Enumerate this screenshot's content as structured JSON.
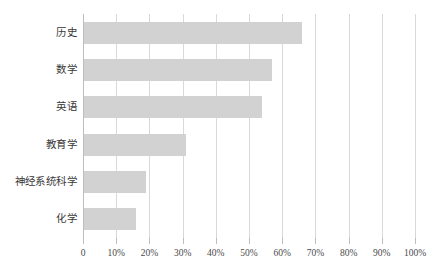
{
  "chart_data": {
    "type": "bar",
    "orientation": "horizontal",
    "title": "",
    "subtitle": "",
    "xlabel": "",
    "ylabel": "",
    "categories": [
      "历史",
      "数学",
      "英语",
      "教育学",
      "神经系统科学",
      "化学"
    ],
    "values": [
      66,
      57,
      54,
      31,
      19,
      16
    ],
    "value_unit": "%",
    "xlim": [
      0,
      100
    ],
    "xticks": [
      0,
      10,
      20,
      30,
      40,
      50,
      60,
      70,
      80,
      90,
      100
    ],
    "xtick_labels": [
      "0",
      "10%",
      "20%",
      "30%",
      "40%",
      "50%",
      "60%",
      "70%",
      "80%",
      "90%",
      "100%"
    ],
    "grid": true,
    "grid_axis": "x",
    "legend": false,
    "legend_position": "none",
    "series": [
      {
        "name": "",
        "values": [
          66,
          57,
          54,
          31,
          19,
          16
        ]
      }
    ],
    "colors": {
      "bar_fill": "#d2d2d2",
      "gridline": "#d9d9d9",
      "axis": "#bdbdbd",
      "background": "#ffffff",
      "category_text": "#3a3a3a",
      "tick_text": "#4a4a4a"
    }
  }
}
